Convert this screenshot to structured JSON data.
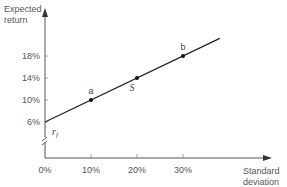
{
  "chart_data": {
    "type": "line",
    "title": "",
    "xlabel": "Standard deviation",
    "ylabel": "Expected return",
    "xlabel_lines": [
      "Standard",
      "deviation"
    ],
    "ylabel_lines": [
      "Expected",
      "return"
    ],
    "x_ticks": [
      0,
      10,
      20,
      30
    ],
    "x_tick_labels": [
      "0%",
      "10%",
      "20%",
      "30%"
    ],
    "y_ticks": [
      6,
      10,
      14,
      18
    ],
    "y_tick_labels": [
      "6%",
      "10%",
      "14%",
      "18%"
    ],
    "xlim": [
      0,
      38
    ],
    "ylim_break": true,
    "grid": false,
    "series": [
      {
        "name": "Capital market line",
        "x": [
          0,
          38
        ],
        "y": [
          6,
          21.2
        ]
      }
    ],
    "points": [
      {
        "label": "a",
        "x": 10,
        "y": 10,
        "label_pos": "above"
      },
      {
        "label": "S",
        "x": 20,
        "y": 14,
        "label_pos": "below",
        "italic": true
      },
      {
        "label": "b",
        "x": 30,
        "y": 18,
        "label_pos": "above"
      }
    ],
    "intercept_label": "r_f",
    "intercept_label_main": "r",
    "intercept_label_sub": "f"
  }
}
